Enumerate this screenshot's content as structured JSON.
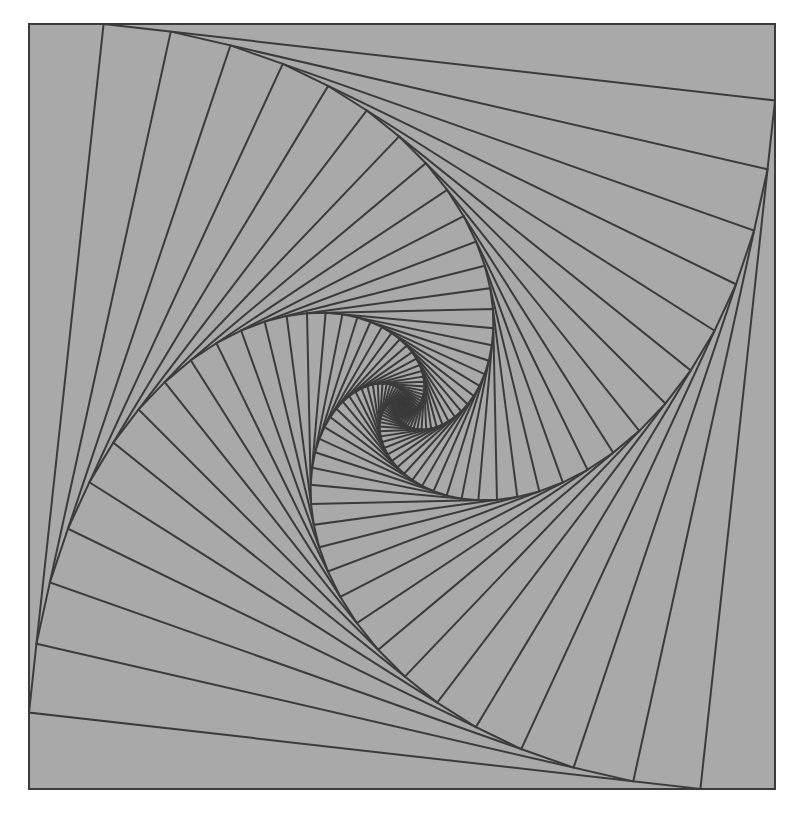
{
  "figure": {
    "canvas": {
      "width": 801,
      "height": 814
    },
    "page_background": "#ffffff",
    "panel_background": "#a9a9a9",
    "line_color": "#3b3b3b",
    "frame": {
      "x0": 29,
      "y0": 24,
      "x1": 775,
      "y1": 789
    },
    "iterations": 70,
    "step_fraction": 0.1,
    "line_width": 2
  }
}
